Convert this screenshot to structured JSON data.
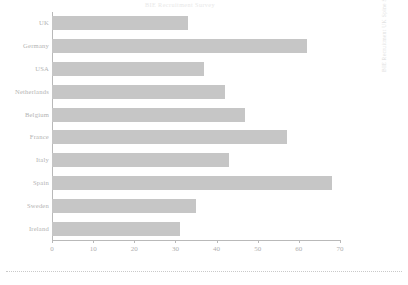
{
  "chart_data": {
    "type": "bar",
    "orientation": "horizontal",
    "title": "BIE Recruitment Survey",
    "categories": [
      "UK",
      "Germany",
      "USA",
      "Netherlands",
      "Belgium",
      "France",
      "Italy",
      "Spain",
      "Sweden",
      "Ireland"
    ],
    "values": [
      33,
      62,
      37,
      42,
      47,
      57,
      43,
      68,
      35,
      31
    ],
    "xlabel": "",
    "ylabel": "",
    "xlim": [
      0,
      70
    ],
    "xticks": [
      0,
      10,
      20,
      30,
      40,
      50,
      60,
      70
    ],
    "xtick_labels": [
      "0",
      "10",
      "20",
      "30",
      "40",
      "50",
      "60",
      "70"
    ],
    "grid": false,
    "legend": null,
    "bar_color": "#c6c6c6",
    "axis_color": "#b9b9b9",
    "text_color": "#b3b3b3"
  },
  "side_caption": "BIE Recruitment UK Spine Summer 2003"
}
